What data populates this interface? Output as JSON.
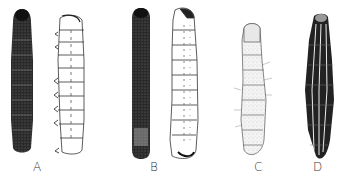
{
  "figure": {
    "panels": [
      {
        "label": "A",
        "views": [
          "dorsal-dark",
          "lateral-outline"
        ]
      },
      {
        "label": "B",
        "views": [
          "dorsal-dark",
          "lateral-outline"
        ]
      },
      {
        "label": "C",
        "views": [
          "lateral-shaded"
        ]
      },
      {
        "label": "D",
        "views": [
          "dorsal-striped"
        ]
      }
    ],
    "colors": {
      "ink": "#1a1a1a",
      "paper": "#ffffff"
    }
  }
}
